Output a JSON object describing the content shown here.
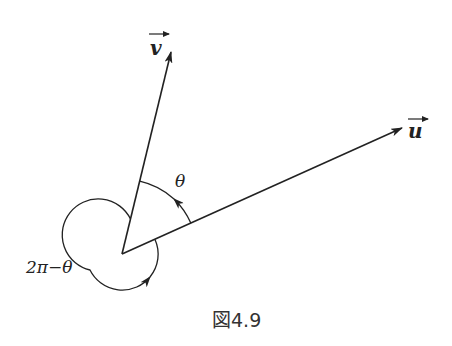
{
  "figure": {
    "caption": "図4.9",
    "origin": {
      "x": 122,
      "y": 254
    },
    "vectors": [
      {
        "name": "v",
        "label": "v",
        "tip": {
          "x": 171,
          "y": 51
        }
      },
      {
        "name": "u",
        "label": "u",
        "tip": {
          "x": 402,
          "y": 128
        }
      }
    ],
    "angles": [
      {
        "label": "θ",
        "description": "angle from u to v (counterclockwise)"
      },
      {
        "label": "2π−θ",
        "description": "reflex angle from v around to u"
      }
    ],
    "colors": {
      "stroke": "#222222",
      "background": "#ffffff"
    }
  }
}
